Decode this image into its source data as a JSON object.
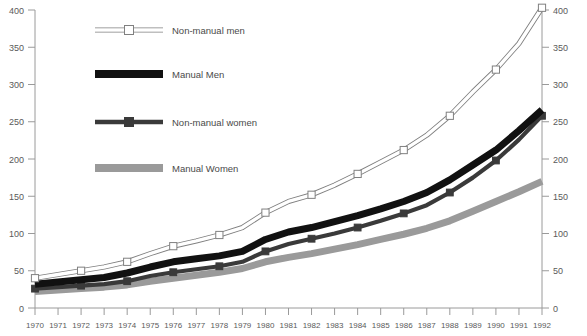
{
  "chart_data": {
    "type": "line",
    "title": "",
    "subtitle": "",
    "xlabel": "",
    "ylabel": "",
    "xlim": [
      1970,
      1992
    ],
    "ylim": [
      0,
      400
    ],
    "grid": false,
    "legend_position": "top-left inside plot",
    "y_axis_left": {
      "ticks": [
        0,
        50,
        100,
        150,
        200,
        250,
        300,
        350,
        400
      ],
      "tick_labels": [
        "0",
        "50",
        "100",
        "150",
        "200",
        "250",
        "300",
        "350",
        "400"
      ]
    },
    "y_axis_right": {
      "ticks": [
        0,
        50,
        100,
        150,
        200,
        250,
        300,
        350,
        400
      ],
      "tick_labels": [
        "0",
        "50",
        "100",
        "150",
        "200",
        "250",
        "300",
        "350",
        "400"
      ]
    },
    "categories": [
      1970,
      1971,
      1972,
      1973,
      1974,
      1975,
      1976,
      1977,
      1978,
      1979,
      1980,
      1981,
      1982,
      1983,
      1984,
      1985,
      1986,
      1987,
      1988,
      1989,
      1990,
      1991,
      1992
    ],
    "x_tick_labels": [
      "1970",
      "1971",
      "1972",
      "1973",
      "1974",
      "1975",
      "1976",
      "1977",
      "1978",
      "1979",
      "1980",
      "1981",
      "1982",
      "1983",
      "1984",
      "1985",
      "1986",
      "1987",
      "1988",
      "1989",
      "1990",
      "1991",
      "1992"
    ],
    "series": [
      {
        "name": "Non-manual men",
        "color": "#ffffff",
        "stroke": "#808080",
        "marker": "open-square",
        "values": [
          40,
          45,
          50,
          55,
          62,
          73,
          83,
          90,
          98,
          108,
          128,
          143,
          152,
          165,
          180,
          196,
          212,
          232,
          258,
          290,
          320,
          355,
          403
        ]
      },
      {
        "name": "Manual Men",
        "color": "#111111",
        "stroke": "#111111",
        "marker": "none",
        "values": [
          32,
          35,
          38,
          41,
          47,
          55,
          62,
          66,
          70,
          76,
          92,
          102,
          108,
          116,
          124,
          133,
          143,
          155,
          172,
          192,
          212,
          238,
          266
        ]
      },
      {
        "name": "Non-manual women",
        "color": "#3a3a3a",
        "stroke": "#3a3a3a",
        "marker": "filled-square",
        "values": [
          26,
          28,
          30,
          32,
          36,
          43,
          48,
          52,
          56,
          62,
          76,
          86,
          93,
          100,
          108,
          117,
          127,
          138,
          155,
          175,
          198,
          226,
          258
        ]
      },
      {
        "name": "Manual Women",
        "color": "#9a9a9a",
        "stroke": "#9a9a9a",
        "marker": "none",
        "values": [
          22,
          24,
          26,
          28,
          31,
          36,
          40,
          44,
          48,
          53,
          62,
          68,
          73,
          79,
          85,
          92,
          99,
          107,
          117,
          130,
          143,
          156,
          170
        ]
      }
    ]
  },
  "legend": {
    "items": [
      {
        "label": "Non-manual men",
        "style": "open-square"
      },
      {
        "label": "Manual Men",
        "style": "thick-black"
      },
      {
        "label": "Non-manual women",
        "style": "filled-square"
      },
      {
        "label": "Manual Women",
        "style": "thick-grey"
      }
    ]
  },
  "colors": {
    "axis": "#9a9a9a",
    "text": "#5a5a5a",
    "non_manual_men": "#808080",
    "manual_men": "#111111",
    "non_manual_women": "#3a3a3a",
    "manual_women": "#9a9a9a",
    "background": "#ffffff"
  }
}
